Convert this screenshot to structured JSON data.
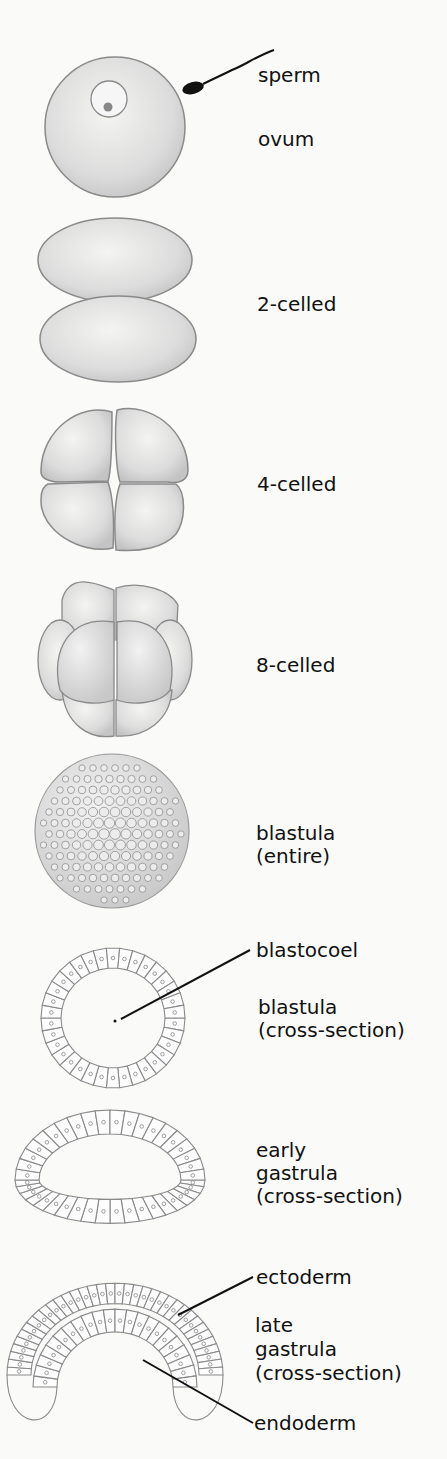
{
  "figure": {
    "stages": [
      {
        "id": "ovum",
        "label": "ovum",
        "extra_label": "sperm"
      },
      {
        "id": "two-celled",
        "label": "2-celled"
      },
      {
        "id": "four-celled",
        "label": "4-celled"
      },
      {
        "id": "eight-celled",
        "label": "8-celled"
      },
      {
        "id": "blastula-entire",
        "label_line1": "blastula",
        "label_line2": "(entire)"
      },
      {
        "id": "blastula-cross",
        "pointer_label": "blastocoel",
        "label_line1": "blastula",
        "label_line2": "(cross-section)"
      },
      {
        "id": "early-gastrula",
        "label_line1": "early",
        "label_line2": "gastrula",
        "label_line3": "(cross-section)"
      },
      {
        "id": "late-gastrula",
        "pointer_top": "ectoderm",
        "label_line1": "late",
        "label_line2": "gastrula",
        "label_line3": "(cross-section)",
        "pointer_bottom": "endoderm"
      }
    ],
    "colors": {
      "outline": "#8a8a8a",
      "stipple": "#bdbdbd",
      "ink": "#111111",
      "paper": "#fafaf8"
    }
  }
}
